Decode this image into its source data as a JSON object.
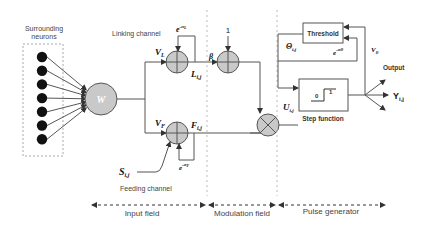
{
  "diagram": {
    "surrounding_neurons": {
      "label_line1": "Surrounding",
      "label_line2": "neurons",
      "count": 7
    },
    "weight": {
      "label": "W"
    },
    "linking_channel": {
      "label": "Linking channel",
      "gain": "V",
      "gain_sub": "L",
      "decay": "e",
      "decay_exp": "-α",
      "decay_exp_sub": "L",
      "output": "L",
      "output_sub": "i,j"
    },
    "modulation": {
      "beta": "β",
      "bias": "1"
    },
    "feeding_channel": {
      "label": "Feeding channel",
      "gain": "V",
      "gain_sub": "F",
      "decay": "e",
      "decay_exp": "-α",
      "decay_exp_sub": "F",
      "output": "F",
      "output_sub": "i,j",
      "stimulus": "S",
      "stimulus_sub": "i,j"
    },
    "internal_activity": {
      "label": "U",
      "sub": "i,j"
    },
    "threshold": {
      "box_label": "Threshold",
      "theta": "Θ",
      "theta_sub": "i,j",
      "decay": "e",
      "decay_exp": "-αθ",
      "gain": "V",
      "gain_sub": "θ"
    },
    "step_function": {
      "label": "Step function",
      "low": "0",
      "high": "1"
    },
    "output": {
      "label": "Output",
      "symbol": "Y",
      "symbol_sub": "i,j"
    },
    "fields": [
      {
        "name": "input-field",
        "label": "Input field"
      },
      {
        "name": "modulation-field",
        "label": "Modulation field"
      },
      {
        "name": "pulse-generator",
        "label": "Pulse generator"
      }
    ]
  }
}
